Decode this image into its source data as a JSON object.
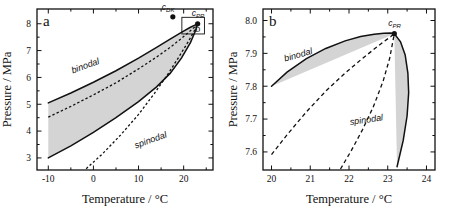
{
  "figure": {
    "colors": {
      "shaded_region": "#d4d4d4",
      "curve": "#111111",
      "frame": "#111111",
      "critical_point": "#111111"
    }
  },
  "chart_data": [
    {
      "id": "panel-a",
      "type": "line",
      "panel_label": "a",
      "title": "",
      "xlabel": "Temperature  /  °C",
      "ylabel": "Pressure  /  MPa",
      "xlim": [
        -12.5,
        26.5
      ],
      "ylim": [
        2.55,
        8.55
      ],
      "xticks": [
        -10,
        0,
        10,
        20
      ],
      "xticklabels": [
        "-10",
        "0",
        "10",
        "20"
      ],
      "yticks": [
        3,
        4,
        5,
        6,
        7,
        8
      ],
      "yticklabels": [
        "3",
        "4",
        "5",
        "6",
        "7",
        "8"
      ],
      "minor_xticks": [
        -5,
        5,
        15,
        25
      ],
      "minor_yticks": [
        3.5,
        4.5,
        5.5,
        6.5,
        7.5
      ],
      "grid": false,
      "legend": "none",
      "series": [
        {
          "name": "binodal",
          "style": "solid",
          "label": "binodal",
          "label_at": [
            -4.6,
            6.15
          ],
          "branch": "upper",
          "x": [
            -10,
            -5,
            0,
            5,
            10,
            14,
            17,
            19.5,
            21.5,
            22.6,
            23.1
          ],
          "y": [
            5.05,
            5.42,
            5.82,
            6.25,
            6.72,
            7.12,
            7.43,
            7.68,
            7.87,
            7.96,
            8.0
          ]
        },
        {
          "name": "binodal",
          "style": "solid",
          "branch": "lower",
          "x": [
            -10,
            -5,
            0,
            5,
            10,
            14,
            17,
            19.5,
            21.5,
            22.6,
            23.1
          ],
          "y": [
            3.0,
            3.45,
            3.95,
            4.5,
            5.1,
            5.65,
            6.15,
            6.72,
            7.3,
            7.73,
            8.0
          ]
        },
        {
          "name": "spinodal",
          "style": "dashed",
          "label": "spinodal",
          "label_at": [
            9.4,
            3.35
          ],
          "branch": "upper",
          "x": [
            -10,
            -5,
            0,
            5,
            10,
            14,
            17,
            19.5,
            21.5,
            22.6,
            23.1
          ],
          "y": [
            4.52,
            4.92,
            5.35,
            5.8,
            6.32,
            6.76,
            7.12,
            7.45,
            7.74,
            7.9,
            8.0
          ]
        },
        {
          "name": "spinodal",
          "style": "dashed",
          "branch": "lower",
          "x": [
            -1.6,
            2,
            6,
            10,
            13.5,
            16.5,
            19,
            21,
            22.3,
            23.1
          ],
          "y": [
            2.6,
            3.15,
            3.85,
            4.62,
            5.4,
            6.12,
            6.78,
            7.33,
            7.72,
            8.0
          ]
        }
      ],
      "annotations": [
        {
          "name": "critical-point-PR",
          "label": "c",
          "subscript": "PR",
          "x": 23.1,
          "y": 8.0,
          "marker": "filled-circle"
        },
        {
          "name": "critical-point-DK",
          "label": "c",
          "subscript": "DK",
          "x": 17.6,
          "y": 8.26,
          "marker": "filled-circle"
        },
        {
          "name": "inset-region-box",
          "label": "b",
          "x0": 19.6,
          "x1": 24.6,
          "y0": 7.62,
          "y1": 8.24
        }
      ]
    },
    {
      "id": "panel-b",
      "type": "line",
      "panel_label": "b",
      "title": "",
      "xlabel": "Temperature  /  °C",
      "ylabel": "Pressure  /  MPa",
      "xlim": [
        19.78,
        24.22
      ],
      "ylim": [
        7.545,
        8.035
      ],
      "xticks": [
        20,
        21,
        22,
        23,
        24
      ],
      "xticklabels": [
        "20",
        "21",
        "22",
        "23",
        "24"
      ],
      "yticks": [
        7.6,
        7.7,
        7.8,
        7.9,
        8.0
      ],
      "yticklabels": [
        "7.6",
        "7.7",
        "7.8",
        "7.9",
        "8.0"
      ],
      "minor_xticks": [
        20.5,
        21.5,
        22.5,
        23.5
      ],
      "minor_yticks": [
        7.65,
        7.75,
        7.85,
        7.95
      ],
      "grid": false,
      "legend": "none",
      "series": [
        {
          "name": "binodal",
          "style": "solid",
          "label": "binodal",
          "label_at": [
            20.35,
            7.875
          ],
          "branch": "upper",
          "x": [
            20.0,
            20.4,
            20.9,
            21.4,
            21.9,
            22.3,
            22.65,
            22.9,
            23.08,
            23.17
          ],
          "y": [
            7.8,
            7.843,
            7.884,
            7.915,
            7.938,
            7.951,
            7.958,
            7.961,
            7.962,
            7.96
          ]
        },
        {
          "name": "binodal",
          "style": "solid",
          "branch": "lower",
          "x": [
            23.17,
            23.33,
            23.45,
            23.52,
            23.54,
            23.5,
            23.4,
            23.24
          ],
          "y": [
            7.96,
            7.935,
            7.895,
            7.84,
            7.78,
            7.71,
            7.635,
            7.555
          ]
        },
        {
          "name": "spinodal",
          "style": "dashed",
          "label": "spinodal",
          "label_at": [
            22.03,
            7.682
          ],
          "branch": "upper",
          "x": [
            20.0,
            20.4,
            20.9,
            21.4,
            21.9,
            22.3,
            22.65,
            22.9,
            23.08,
            23.17
          ],
          "y": [
            7.592,
            7.652,
            7.722,
            7.785,
            7.84,
            7.88,
            7.913,
            7.936,
            7.951,
            7.96
          ]
        },
        {
          "name": "spinodal",
          "style": "dashed",
          "branch": "lower",
          "x": [
            21.78,
            22.05,
            22.35,
            22.63,
            22.88,
            23.05,
            23.17
          ],
          "y": [
            7.548,
            7.602,
            7.668,
            7.738,
            7.815,
            7.885,
            7.96
          ]
        }
      ],
      "annotations": [
        {
          "name": "critical-point-PR",
          "label": "c",
          "subscript": "PR",
          "x": 23.17,
          "y": 7.96,
          "marker": "filled-circle"
        }
      ]
    }
  ]
}
